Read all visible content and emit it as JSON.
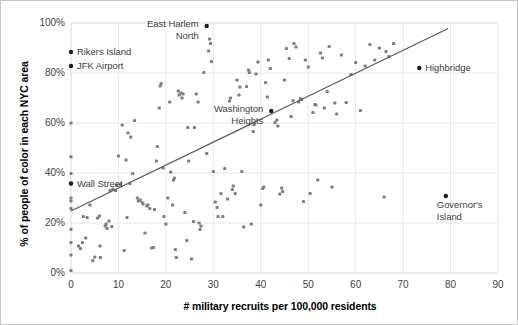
{
  "chart_data": {
    "type": "scatter",
    "title": "",
    "xlabel": "# military recruits per 100,000 residents",
    "ylabel": "% of people of color in each NYC area",
    "xlim": [
      0,
      90
    ],
    "ylim": [
      0,
      1.0
    ],
    "xticks": [
      "0",
      "10",
      "20",
      "30",
      "40",
      "50",
      "60",
      "70",
      "80",
      "90"
    ],
    "xtick_values": [
      0,
      10,
      20,
      30,
      40,
      50,
      60,
      70,
      80,
      90
    ],
    "yticks": [
      "0%",
      "20%",
      "40%",
      "60%",
      "80%",
      "100%"
    ],
    "ytick_values": [
      0,
      0.2,
      0.4,
      0.6,
      0.8,
      1.0
    ],
    "grid": "both-light",
    "legend": "none",
    "marker_color": "#7f7f7f",
    "highlight_color": "#1a1a1a",
    "trendline_color": "#595959",
    "gridline_color": "#e8e8e8",
    "axis_color": "#d9d9d9",
    "trendline": {
      "x0": 0,
      "y0": 0.248,
      "x1": 79.5,
      "y1": 0.978
    },
    "annotations": [
      {
        "label": "East Harlem\nNorth",
        "x": 28.6,
        "y": 0.988,
        "align": "left",
        "dx": -6,
        "dy": -8
      },
      {
        "label": "Rikers Island",
        "x": 0.0,
        "y": 0.884,
        "align": "right",
        "dx": 6,
        "dy": -6
      },
      {
        "label": "JFK Airport",
        "x": 0.0,
        "y": 0.828,
        "align": "right",
        "dx": 6,
        "dy": -6
      },
      {
        "label": "Washington\nHeights",
        "x": 42.2,
        "y": 0.648,
        "align": "left",
        "dx": -6,
        "dy": -8
      },
      {
        "label": "Highbridge",
        "x": 73.4,
        "y": 0.82,
        "align": "right",
        "dx": 6,
        "dy": -6
      },
      {
        "label": "Wall Street",
        "x": 0.0,
        "y": 0.358,
        "align": "right",
        "dx": 6,
        "dy": -6
      },
      {
        "label": "Governor's\nIsland",
        "x": 79.0,
        "y": 0.308,
        "align": "right",
        "dx": -9,
        "dy": 3
      }
    ],
    "highlighted_points": [
      {
        "name": "East Harlem North",
        "x": 28.6,
        "y": 0.988
      },
      {
        "name": "Rikers Island",
        "x": 0.0,
        "y": 0.884
      },
      {
        "name": "JFK Airport",
        "x": 0.0,
        "y": 0.828
      },
      {
        "name": "Washington Heights",
        "x": 42.2,
        "y": 0.648
      },
      {
        "name": "Highbridge",
        "x": 73.4,
        "y": 0.82
      },
      {
        "name": "Wall Street",
        "x": 0.0,
        "y": 0.358
      },
      {
        "name": "Governor's Island",
        "x": 79.0,
        "y": 0.308
      }
    ],
    "points": [
      [
        0.0,
        0.6
      ],
      [
        0.0,
        0.465
      ],
      [
        0.0,
        0.398
      ],
      [
        0.0,
        0.3
      ],
      [
        0.0,
        0.288
      ],
      [
        0.0,
        0.258
      ],
      [
        0.0,
        0.175
      ],
      [
        0.0,
        0.122
      ],
      [
        0.0,
        0.072
      ],
      [
        0.0,
        0.01
      ],
      [
        1.6,
        0.108
      ],
      [
        2.0,
        0.098
      ],
      [
        2.4,
        0.122
      ],
      [
        2.6,
        0.226
      ],
      [
        3.1,
        0.14
      ],
      [
        3.4,
        0.222
      ],
      [
        4.0,
        0.272
      ],
      [
        4.6,
        0.05
      ],
      [
        5.0,
        0.064
      ],
      [
        5.6,
        0.22
      ],
      [
        6.0,
        0.228
      ],
      [
        6.1,
        0.108
      ],
      [
        6.2,
        0.062
      ],
      [
        7.2,
        0.188
      ],
      [
        7.4,
        0.196
      ],
      [
        7.6,
        0.178
      ],
      [
        8.0,
        0.208
      ],
      [
        8.2,
        0.33
      ],
      [
        8.6,
        0.186
      ],
      [
        8.8,
        0.336
      ],
      [
        9.4,
        0.33
      ],
      [
        9.6,
        0.352
      ],
      [
        10.0,
        0.468
      ],
      [
        10.4,
        0.354
      ],
      [
        10.8,
        0.592
      ],
      [
        11.2,
        0.09
      ],
      [
        11.6,
        0.452
      ],
      [
        11.8,
        0.222
      ],
      [
        12.0,
        0.56
      ],
      [
        12.4,
        0.358
      ],
      [
        12.6,
        0.544
      ],
      [
        13.0,
        0.398
      ],
      [
        13.4,
        0.61
      ],
      [
        14.0,
        0.3
      ],
      [
        14.2,
        0.288
      ],
      [
        14.6,
        0.292
      ],
      [
        15.0,
        0.282
      ],
      [
        15.2,
        0.276
      ],
      [
        15.6,
        0.16
      ],
      [
        16.0,
        0.268
      ],
      [
        16.2,
        0.272
      ],
      [
        16.6,
        0.258
      ],
      [
        17.0,
        0.1
      ],
      [
        17.4,
        0.102
      ],
      [
        17.6,
        0.254
      ],
      [
        18.0,
        0.448
      ],
      [
        18.2,
        0.506
      ],
      [
        18.6,
        0.66
      ],
      [
        18.8,
        0.748
      ],
      [
        19.0,
        0.758
      ],
      [
        19.4,
        0.42
      ],
      [
        19.6,
        0.226
      ],
      [
        20.0,
        0.196
      ],
      [
        20.4,
        0.3
      ],
      [
        20.8,
        0.684
      ],
      [
        21.0,
        0.404
      ],
      [
        21.4,
        0.272
      ],
      [
        21.6,
        0.372
      ],
      [
        21.8,
        0.38
      ],
      [
        22.0,
        0.094
      ],
      [
        22.2,
        0.062
      ],
      [
        22.6,
        0.728
      ],
      [
        22.8,
        0.712
      ],
      [
        23.2,
        0.72
      ],
      [
        23.4,
        0.7
      ],
      [
        23.6,
        0.716
      ],
      [
        24.0,
        0.242
      ],
      [
        24.4,
        0.13
      ],
      [
        24.6,
        0.582
      ],
      [
        24.8,
        0.448
      ],
      [
        25.4,
        0.056
      ],
      [
        25.8,
        0.206
      ],
      [
        26.0,
        0.582
      ],
      [
        26.4,
        0.716
      ],
      [
        26.8,
        0.684
      ],
      [
        27.0,
        0.2
      ],
      [
        27.2,
        0.174
      ],
      [
        27.4,
        0.188
      ],
      [
        28.0,
        0.802
      ],
      [
        28.6,
        0.478
      ],
      [
        29.0,
        0.888
      ],
      [
        29.2,
        0.936
      ],
      [
        29.4,
        0.918
      ],
      [
        29.6,
        0.846
      ],
      [
        30.0,
        0.406
      ],
      [
        30.4,
        0.284
      ],
      [
        30.8,
        0.262
      ],
      [
        31.0,
        0.226
      ],
      [
        31.6,
        0.318
      ],
      [
        32.0,
        0.226
      ],
      [
        32.4,
        0.418
      ],
      [
        33.0,
        0.296
      ],
      [
        33.4,
        0.688
      ],
      [
        33.6,
        0.7
      ],
      [
        34.0,
        0.334
      ],
      [
        34.2,
        0.348
      ],
      [
        34.6,
        0.318
      ],
      [
        35.0,
        0.772
      ],
      [
        35.4,
        0.712
      ],
      [
        35.6,
        0.744
      ],
      [
        36.0,
        0.406
      ],
      [
        36.4,
        0.184
      ],
      [
        37.0,
        0.746
      ],
      [
        37.4,
        0.812
      ],
      [
        37.6,
        0.802
      ],
      [
        38.0,
        0.196
      ],
      [
        38.4,
        0.566
      ],
      [
        38.6,
        0.594
      ],
      [
        39.0,
        0.796
      ],
      [
        39.4,
        0.844
      ],
      [
        40.0,
        0.272
      ],
      [
        40.4,
        0.338
      ],
      [
        40.6,
        0.344
      ],
      [
        41.0,
        0.762
      ],
      [
        41.4,
        0.704
      ],
      [
        41.6,
        0.852
      ],
      [
        42.0,
        0.818
      ],
      [
        43.0,
        0.602
      ],
      [
        43.4,
        0.612
      ],
      [
        43.6,
        0.588
      ],
      [
        44.0,
        0.316
      ],
      [
        44.4,
        0.34
      ],
      [
        44.6,
        0.326
      ],
      [
        45.0,
        0.772
      ],
      [
        45.4,
        0.898
      ],
      [
        46.0,
        0.858
      ],
      [
        46.4,
        0.626
      ],
      [
        46.8,
        0.69
      ],
      [
        47.0,
        0.918
      ],
      [
        47.4,
        0.904
      ],
      [
        48.0,
        0.684
      ],
      [
        48.4,
        0.698
      ],
      [
        48.6,
        0.694
      ],
      [
        49.0,
        0.286
      ],
      [
        49.4,
        0.852
      ],
      [
        50.0,
        0.824
      ],
      [
        50.4,
        0.318
      ],
      [
        51.0,
        0.642
      ],
      [
        51.4,
        0.674
      ],
      [
        51.6,
        0.672
      ],
      [
        52.0,
        0.372
      ],
      [
        52.6,
        0.88
      ],
      [
        53.0,
        0.86
      ],
      [
        53.4,
        0.66
      ],
      [
        54.0,
        0.726
      ],
      [
        54.4,
        0.906
      ],
      [
        55.0,
        0.344
      ],
      [
        55.6,
        0.68
      ],
      [
        56.0,
        0.636
      ],
      [
        57.0,
        0.872
      ],
      [
        58.0,
        0.682
      ],
      [
        59.0,
        0.794
      ],
      [
        60.0,
        0.842
      ],
      [
        61.0,
        0.65
      ],
      [
        62.0,
        0.828
      ],
      [
        63.0,
        0.914
      ],
      [
        64.0,
        0.852
      ],
      [
        65.0,
        0.9
      ],
      [
        66.0,
        0.304
      ],
      [
        66.4,
        0.886
      ],
      [
        67.0,
        0.866
      ],
      [
        68.0,
        0.918
      ]
    ]
  }
}
